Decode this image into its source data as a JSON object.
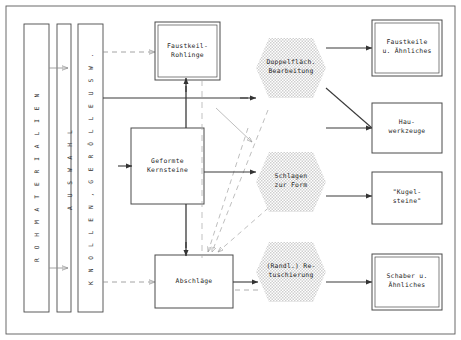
{
  "diagram": {
    "columns": [
      {
        "id": "rohmaterialien",
        "label": "R O H M A T E R I A L I E N"
      },
      {
        "id": "auswahl",
        "label": "A U S W A H L"
      },
      {
        "id": "knollen",
        "label": "K N O L L E N ,   G E R Ö L L E   U S W ."
      }
    ],
    "stage_boxes": [
      {
        "id": "faustkeil-rohlinge",
        "label": "Faustkeil-\nRohlinge",
        "style": "double"
      },
      {
        "id": "geformte-kernsteine",
        "label": "Geformte\nKernsteine",
        "style": "single"
      },
      {
        "id": "abschlaege",
        "label": "Abschläge",
        "style": "single"
      }
    ],
    "process_hexagons": [
      {
        "id": "doppelflaech-bearbeitung",
        "label": "Doppelfläch.\nBearbeitung"
      },
      {
        "id": "schlagen-zur-form",
        "label": "Schlagen\nzur Form"
      },
      {
        "id": "randl-retuschierung",
        "label": "(Randl.) Re-\ntuschierung"
      }
    ],
    "product_boxes": [
      {
        "id": "faustkeile",
        "label": "Faustkeile\nu. Ähnliches",
        "style": "double"
      },
      {
        "id": "hauwerkzeuge",
        "label": "Hau-\nwerkzeuge",
        "style": "single"
      },
      {
        "id": "kugelsteine",
        "label": "\"Kugel-\nsteine\"",
        "style": "single"
      },
      {
        "id": "schaber",
        "label": "Schaber u.\nÄhnliches",
        "style": "double"
      }
    ],
    "colors": {
      "line": "#3a3a3a",
      "dashed": "#8d8d8d",
      "hexagon_fill": "#d9d9d9",
      "box_stroke": "#4a4a4a",
      "text": "#262626",
      "background": "#ffffff"
    }
  }
}
